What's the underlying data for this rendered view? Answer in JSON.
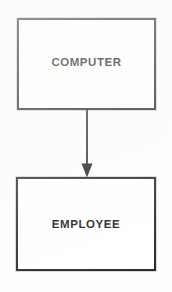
{
  "diagram": {
    "type": "entity-relationship-diagram",
    "orientation": "vertical",
    "background_color": "#fdfdfc",
    "stroke_color": "#222222",
    "text_color": "#111111",
    "nodes": [
      {
        "id": "computer",
        "label": "COMPUTER",
        "shape": "rectangle",
        "x": 17,
        "y": 18,
        "width": 139,
        "height": 92
      },
      {
        "id": "employee",
        "label": "EMPLOYEE",
        "shape": "rectangle",
        "x": 16,
        "y": 177,
        "width": 140,
        "height": 94
      }
    ],
    "edges": [
      {
        "id": "computer-to-employee",
        "from": "computer",
        "to": "employee",
        "label": "",
        "style": "solid",
        "arrowhead": "filled-triangle",
        "direction": "down",
        "x": 87,
        "y_start": 110,
        "y_end": 177
      }
    ]
  }
}
